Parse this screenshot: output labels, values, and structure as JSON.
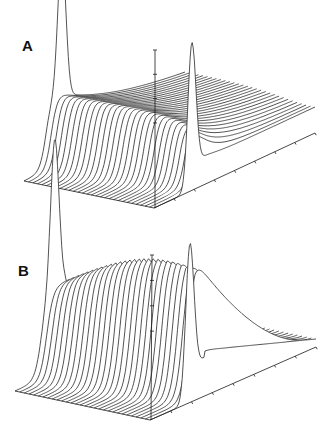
{
  "figure": {
    "panels": [
      {
        "id": "A",
        "label": "A"
      },
      {
        "id": "B",
        "label": "B"
      }
    ],
    "colors": {
      "line": "#1a1a1a",
      "background": "#ffffff",
      "label": "#111111"
    }
  },
  "chart_data": [
    {
      "type": "area",
      "subtype": "3d-waterfall",
      "title": "A",
      "xlabel": "",
      "ylabel": "",
      "zlabel": "",
      "n_traces": 30,
      "axis_tick_labels": [],
      "grid": false,
      "legend": null,
      "description": "Stacked traces; front and back traces show a sharp peak near x=0.235 (height ~140). Intermediate traces rise sigmoidally to a plateau (~80 front, ~70 back) that decays toward a tail level ~26.",
      "projection": {
        "origin": [
          24,
          181
        ],
        "depth_vec": [
          130,
          27
        ],
        "x_vec": [
          161,
          -75
        ],
        "vertical_axis_top": [
          155,
          50
        ]
      },
      "params": {
        "peak_x": 0.235,
        "peak_w": 0.035,
        "peak_h": 140,
        "tail": 26,
        "rise_start": 0.14,
        "rise_shift": 0.12,
        "rise_w": 0.02,
        "plateau_front": 80,
        "plateau_back": 70,
        "decay_front": 0.45,
        "decay_back": 0.05,
        "mode": "decay"
      }
    },
    {
      "type": "area",
      "subtype": "3d-waterfall",
      "title": "B",
      "xlabel": "",
      "ylabel": "",
      "zlabel": "",
      "n_traces": 30,
      "axis_tick_labels": [],
      "grid": false,
      "legend": null,
      "description": "Stacked traces; front and back traces show a sharp peak near x=0.24 (height ~148). Plateau height grows across traces from ~88 to ~137 forming a hump, then falls off toward a low tail ~8.",
      "projection": {
        "origin": [
          15,
          391
        ],
        "depth_vec": [
          135,
          29
        ],
        "x_vec": [
          166,
          -73
        ],
        "vertical_axis_top": [
          152,
          255
        ]
      },
      "params": {
        "peak_x": 0.24,
        "peak_w": 0.035,
        "peak_h": 148,
        "tail": 8,
        "rise_start": 0.16,
        "rise_shift": 0.1,
        "rise_w": 0.02,
        "plateau_front": 88,
        "plateau_back": 137,
        "plateau_end": 0.3,
        "mode": "hump"
      }
    }
  ]
}
